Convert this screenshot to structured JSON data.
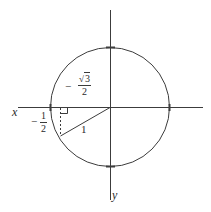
{
  "diagram": {
    "type": "unit-circle",
    "colors": {
      "stroke": "#3c3c3c",
      "text": "#2a2a2a",
      "background": "#ffffff"
    },
    "axes": {
      "x_label": "x",
      "y_label": "y"
    },
    "circle": {
      "center": [
        110,
        107
      ],
      "radius": 59
    },
    "point": {
      "x": -0.5,
      "y": -0.866
    },
    "labels": {
      "radius_label": "1",
      "horizontal_leg": {
        "sign": "−",
        "numerator": "1",
        "denominator": "2"
      },
      "vertical_leg": {
        "sign": "−",
        "sqrt_symbol": "√",
        "radicand": "3",
        "denominator": "2"
      }
    }
  }
}
